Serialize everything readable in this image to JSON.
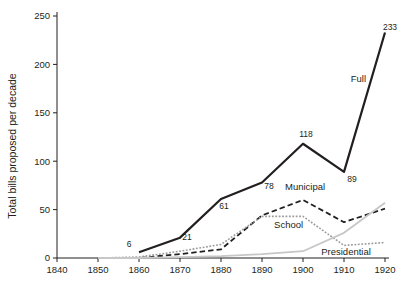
{
  "chart_data": {
    "type": "line",
    "title": "",
    "xlabel": "",
    "ylabel": "Total bills proposed per decade",
    "xlim": [
      1840,
      1920
    ],
    "ylim": [
      0,
      250
    ],
    "grid": false,
    "legend_position": "inline-annotations",
    "x": [
      1850,
      1860,
      1870,
      1880,
      1890,
      1900,
      1910,
      1920
    ],
    "xticks": [
      "1840",
      "1850",
      "1860",
      "1870",
      "1880",
      "1890",
      "1900",
      "1910",
      "1920"
    ],
    "yticks": [
      "0",
      "50",
      "100",
      "150",
      "200",
      "250"
    ],
    "series": [
      {
        "name": "Full",
        "label": "Full",
        "style": "solid",
        "color": "#231f20",
        "width": 2.2,
        "x": [
          1860,
          1870,
          1880,
          1890,
          1900,
          1910,
          1920
        ],
        "values": [
          6,
          21,
          61,
          78,
          118,
          89,
          233
        ],
        "point_labels": [
          "6",
          "21",
          "61",
          "78",
          "118",
          "89",
          "233"
        ]
      },
      {
        "name": "Municipal",
        "label": "Municipal",
        "style": "dashed",
        "color": "#231f20",
        "width": 1.8,
        "x": [
          1850,
          1860,
          1870,
          1880,
          1890,
          1900,
          1910,
          1920
        ],
        "values": [
          0,
          0,
          4,
          9,
          44,
          60,
          37,
          51
        ]
      },
      {
        "name": "School",
        "label": "School",
        "style": "dotted",
        "color": "#9b9b9b",
        "width": 1.6,
        "x": [
          1850,
          1860,
          1870,
          1880,
          1890,
          1900,
          1910,
          1920
        ],
        "values": [
          0,
          1,
          7,
          14,
          43,
          43,
          13,
          16
        ]
      },
      {
        "name": "Presidential",
        "label": "Presidential",
        "style": "solid",
        "color": "#c7c7c7",
        "width": 1.8,
        "x": [
          1850,
          1860,
          1870,
          1880,
          1890,
          1900,
          1910,
          1920
        ],
        "values": [
          0,
          0,
          1,
          2,
          4,
          7,
          26,
          57
        ]
      }
    ],
    "annotations": [
      {
        "name": "full-label",
        "text": "Full",
        "x": 1913.5,
        "y": 182,
        "anchor": "middle"
      },
      {
        "name": "municipal-label",
        "text": "Municipal",
        "x": 1900.5,
        "y": 70,
        "anchor": "middle"
      },
      {
        "name": "school-label",
        "text": "School",
        "x": 1896.5,
        "y": 31,
        "anchor": "middle"
      },
      {
        "name": "presidential-label",
        "text": "Presidential",
        "x": 1910.5,
        "y": 3,
        "anchor": "middle"
      }
    ]
  },
  "colors": {
    "axis": "#231f20",
    "full": "#231f20",
    "municipal": "#231f20",
    "school": "#9b9b9b",
    "presidential": "#c7c7c7",
    "background": "#ffffff"
  }
}
